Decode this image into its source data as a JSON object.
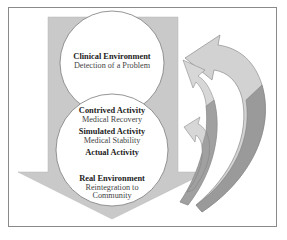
{
  "diagram": {
    "colors": {
      "frame_border": "#8a8a8a",
      "arrow_fill": "#c9c9c9",
      "circle_fill": "#ffffff",
      "circle_stroke": "#7a7a7a",
      "curve_arrow_light": "#d2d2d2",
      "curve_arrow_dark": "#9a9a9a"
    },
    "stages": [
      {
        "title": "Clinical Environment",
        "subtitle": "Detection of a Problem"
      },
      {
        "title": "Contrived Activity",
        "subtitle": "Medical Recovery"
      },
      {
        "title": "Simulated Activity",
        "subtitle": "Medical Stability"
      },
      {
        "title": "Actual Activity",
        "subtitle": ""
      },
      {
        "title": "Real Environment",
        "subtitle": "Reintegration to Community",
        "subtitle_line1": "Reintegration to",
        "subtitle_line2": "Community"
      }
    ],
    "flow_direction": "down",
    "feedback_arrows": 3
  }
}
